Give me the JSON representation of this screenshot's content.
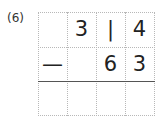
{
  "problem": {
    "label": "(6)",
    "operation": "subtraction",
    "rows": [
      [
        "",
        "3",
        "|",
        "4"
      ],
      [
        "—",
        "",
        "6",
        "3"
      ],
      [
        "",
        "",
        "",
        ""
      ]
    ],
    "minuend": "314",
    "subtrahend": "63"
  }
}
